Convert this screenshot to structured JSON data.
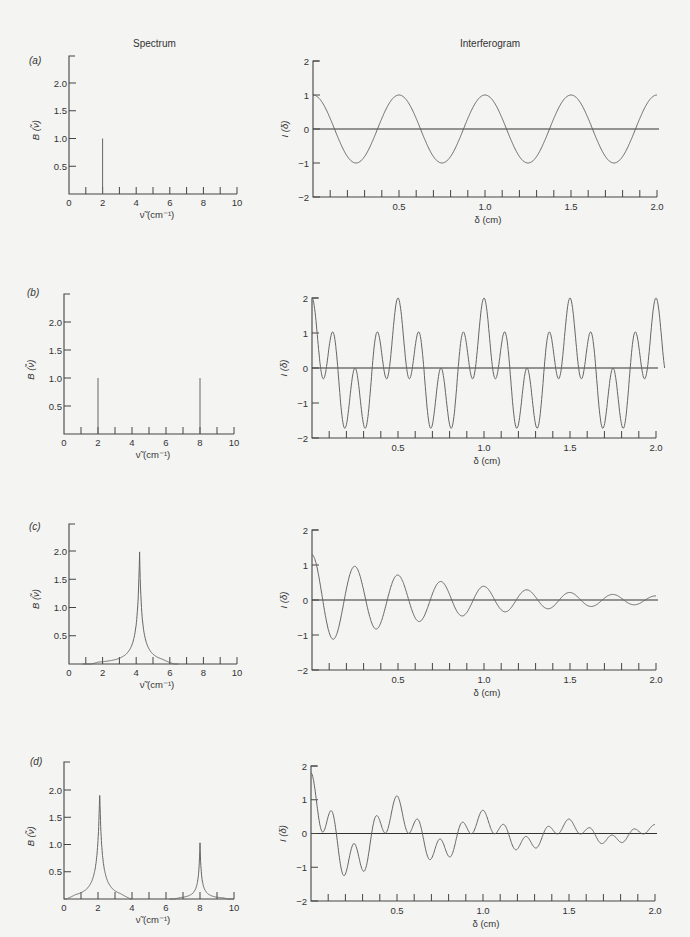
{
  "headers": {
    "spectrum": "Spectrum",
    "interferogram": "Interferogram"
  },
  "axis_labels": {
    "spectrum_y": "B (ν̃)",
    "spectrum_x": "ν̃ (cm⁻¹)",
    "interferogram_y": "I (δ)",
    "interferogram_x": "δ (cm)"
  },
  "colors": {
    "axis": "#444444",
    "curve": "#666666",
    "background": "#f4f4f2"
  },
  "chart_data": [
    {
      "panel": "(a)",
      "type": "line",
      "subplot": "spectrum",
      "xlim": [
        0,
        10
      ],
      "ylim": [
        0,
        2.4
      ],
      "xticks": [
        0,
        2,
        4,
        6,
        8,
        10
      ],
      "yticks": [
        0.5,
        1.0,
        1.5,
        2.0
      ],
      "xlabel": "ν̃ (cm⁻¹)",
      "ylabel": "B (ν̃)",
      "lines": [
        {
          "x": 2,
          "height": 1.0
        }
      ]
    },
    {
      "panel": "(a)",
      "type": "line",
      "subplot": "interferogram",
      "xlim": [
        0,
        2.0
      ],
      "ylim": [
        -2,
        2
      ],
      "xticks": [
        0.5,
        1.0,
        1.5,
        2.0
      ],
      "yticks": [
        -2,
        -1,
        0,
        1,
        2
      ],
      "xlabel": "δ (cm)",
      "ylabel": "I (δ)",
      "function": "cos(2π·2·δ)",
      "components": [
        {
          "wavenumber": 2,
          "amplitude": 1.0,
          "width": 0
        }
      ]
    },
    {
      "panel": "(b)",
      "type": "line",
      "subplot": "spectrum",
      "xlim": [
        0,
        10
      ],
      "ylim": [
        0,
        2.4
      ],
      "xticks": [
        0,
        2,
        4,
        6,
        8,
        10
      ],
      "yticks": [
        0.5,
        1.0,
        1.5,
        2.0
      ],
      "xlabel": "ν̃ (cm⁻¹)",
      "ylabel": "B (ν̃)",
      "lines": [
        {
          "x": 2,
          "height": 1.0
        },
        {
          "x": 8,
          "height": 1.0
        }
      ]
    },
    {
      "panel": "(b)",
      "type": "line",
      "subplot": "interferogram",
      "xlim": [
        0,
        2.0
      ],
      "ylim": [
        -2,
        2
      ],
      "xticks": [
        0.5,
        1.0,
        1.5,
        2.0
      ],
      "yticks": [
        -2,
        -1,
        0,
        1,
        2
      ],
      "xlabel": "δ (cm)",
      "ylabel": "I (δ)",
      "function": "cos(2π·2·δ) + cos(2π·8·δ)",
      "components": [
        {
          "wavenumber": 2,
          "amplitude": 1.0,
          "width": 0
        },
        {
          "wavenumber": 8,
          "amplitude": 1.0,
          "width": 0
        }
      ]
    },
    {
      "panel": "(c)",
      "type": "line",
      "subplot": "spectrum",
      "xlim": [
        0,
        10
      ],
      "ylim": [
        0,
        2.4
      ],
      "xticks": [
        0,
        2,
        4,
        6,
        8,
        10
      ],
      "yticks": [
        0.5,
        1.0,
        1.5,
        2.0
      ],
      "xlabel": "ν̃ (cm⁻¹)",
      "ylabel": "B (ν̃)",
      "peaks": [
        {
          "center": 4.2,
          "height": 2.0,
          "halfwidth": 0.2,
          "range": [
            0.8,
            6.5
          ]
        }
      ]
    },
    {
      "panel": "(c)",
      "type": "line",
      "subplot": "interferogram",
      "xlim": [
        0,
        2.0
      ],
      "ylim": [
        -2,
        2
      ],
      "xticks": [
        0.5,
        1.0,
        1.5,
        2.0
      ],
      "yticks": [
        -2,
        -1,
        0,
        1,
        2
      ],
      "xlabel": "δ (cm)",
      "ylabel": "I (δ)",
      "function": "damped cosine, start ≈1.3, decays to ≈0.1 by δ=2",
      "components": [
        {
          "wavenumber": 4,
          "amplitude": 1.3,
          "decay": 1.2
        }
      ]
    },
    {
      "panel": "(d)",
      "type": "line",
      "subplot": "spectrum",
      "xlim": [
        0,
        10
      ],
      "ylim": [
        0,
        2.4
      ],
      "xticks": [
        0,
        2,
        4,
        6,
        8,
        10
      ],
      "yticks": [
        0.5,
        1.0,
        1.5,
        2.0
      ],
      "xlabel": "ν̃ (cm⁻¹)",
      "ylabel": "B (ν̃)",
      "peaks": [
        {
          "center": 2.1,
          "height": 2.0,
          "halfwidth": 0.2,
          "range": [
            0,
            4.0
          ]
        },
        {
          "center": 8.0,
          "height": 1.05,
          "halfwidth": 0.12,
          "range": [
            6.2,
            10.0
          ]
        }
      ]
    },
    {
      "panel": "(d)",
      "type": "line",
      "subplot": "interferogram",
      "xlim": [
        0,
        2.0
      ],
      "ylim": [
        -2,
        2
      ],
      "xticks": [
        0.5,
        1.0,
        1.5,
        2.0
      ],
      "yticks": [
        -2,
        -1,
        0,
        1,
        2
      ],
      "xlabel": "δ (cm)",
      "ylabel": "I (δ)",
      "function": "sum of two damped cosines, start ≈1.8",
      "components": [
        {
          "wavenumber": 2,
          "amplitude": 1.1,
          "decay": 1.0
        },
        {
          "wavenumber": 8,
          "amplitude": 0.7,
          "decay": 0.9
        }
      ]
    }
  ],
  "layout": {
    "panels": [
      {
        "label": "(a)",
        "label_pos": [
          29,
          64
        ],
        "spec": {
          "x0": 69,
          "x1": 237,
          "ytop": 56,
          "ybase": 194,
          "ymax_px": 83
        },
        "intf": {
          "x0": 313,
          "x1": 657,
          "ytop": 61,
          "ybase": 197
        }
      },
      {
        "label": "(b)",
        "label_pos": [
          27,
          296
        ],
        "spec": {
          "x0": 64,
          "x1": 234,
          "ytop": 294,
          "ybase": 434,
          "ymax_px": 322
        },
        "intf": {
          "x0": 312,
          "x1": 656,
          "ytop": 298,
          "ybase": 438
        }
      },
      {
        "label": "(c)",
        "label_pos": [
          29,
          530
        ],
        "spec": {
          "x0": 69,
          "x1": 237,
          "ytop": 524,
          "ybase": 664,
          "ymax_px": 551
        },
        "intf": {
          "x0": 312,
          "x1": 656,
          "ytop": 530,
          "ybase": 670
        }
      },
      {
        "label": "(d)",
        "label_pos": [
          30,
          765
        ],
        "spec": {
          "x0": 64,
          "x1": 234,
          "ytop": 762,
          "ybase": 899,
          "ymax_px": 790
        },
        "intf": {
          "x0": 311,
          "x1": 655,
          "ytop": 766,
          "ybase": 901
        }
      }
    ]
  }
}
